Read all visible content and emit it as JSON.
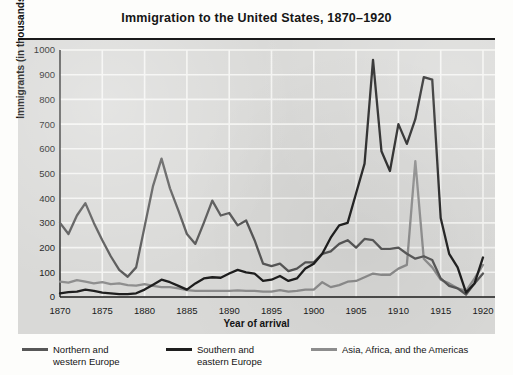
{
  "title": "Immigration to the United States, 1870–1920",
  "axes": {
    "ylabel": "Immigrants (in thousands)",
    "xlabel": "Year of arrival",
    "yticks": [
      "0",
      "100",
      "200",
      "300",
      "400",
      "500",
      "600",
      "700",
      "800",
      "900",
      "1000"
    ],
    "xticks": [
      "1870",
      "1875",
      "1880",
      "1885",
      "1890",
      "1895",
      "1900",
      "1905",
      "1910",
      "1915",
      "1920"
    ]
  },
  "legend": [
    {
      "label_line1": "Northern and",
      "label_line2": "western Europe",
      "color": "#575757"
    },
    {
      "label_line1": "Southern and",
      "label_line2": "eastern Europe",
      "color": "#1e1e1e"
    },
    {
      "label_line1": "Asia, Africa, and the Americas",
      "label_line2": "",
      "color": "#8d8d8d"
    }
  ],
  "colors": {
    "panel": "#d9d9d7",
    "gridline": "#f4f4f2",
    "axis": "#1b1b1b",
    "page": "#fdfdfb"
  },
  "chart_data": {
    "type": "line",
    "title": "Immigration to the United States, 1870–1920",
    "xlabel": "Year of arrival",
    "ylabel": "Immigrants (in thousands)",
    "xlim": [
      1870,
      1920
    ],
    "ylim": [
      0,
      1000
    ],
    "xtick_step": 5,
    "ytick_step": 100,
    "grid": true,
    "legend_position": "below",
    "units": "thousands of immigrants",
    "x": [
      1870,
      1871,
      1872,
      1873,
      1874,
      1875,
      1876,
      1877,
      1878,
      1879,
      1880,
      1881,
      1882,
      1883,
      1884,
      1885,
      1886,
      1887,
      1888,
      1889,
      1890,
      1891,
      1892,
      1893,
      1894,
      1895,
      1896,
      1897,
      1898,
      1899,
      1900,
      1901,
      1902,
      1903,
      1904,
      1905,
      1906,
      1907,
      1908,
      1909,
      1910,
      1911,
      1912,
      1913,
      1914,
      1915,
      1916,
      1917,
      1918,
      1919,
      1920
    ],
    "series": [
      {
        "name": "Northern and western Europe",
        "color": "#575757",
        "values": [
          300,
          255,
          330,
          380,
          300,
          230,
          165,
          110,
          82,
          120,
          285,
          450,
          560,
          440,
          350,
          255,
          215,
          300,
          390,
          330,
          340,
          290,
          310,
          230,
          135,
          125,
          135,
          105,
          115,
          140,
          140,
          175,
          185,
          215,
          230,
          200,
          235,
          230,
          195,
          195,
          200,
          175,
          155,
          165,
          150,
          75,
          45,
          35,
          10,
          55,
          95
        ]
      },
      {
        "name": "Southern and eastern Europe",
        "color": "#1e1e1e",
        "values": [
          15,
          20,
          22,
          30,
          25,
          18,
          15,
          12,
          12,
          15,
          30,
          50,
          70,
          60,
          45,
          30,
          55,
          75,
          80,
          78,
          95,
          110,
          100,
          95,
          65,
          70,
          85,
          65,
          75,
          115,
          135,
          175,
          240,
          290,
          300,
          420,
          540,
          960,
          590,
          510,
          700,
          620,
          720,
          890,
          880,
          320,
          175,
          120,
          18,
          55,
          160
        ]
      },
      {
        "name": "Asia, Africa, and the Americas",
        "color": "#8d8d8d",
        "values": [
          62,
          58,
          68,
          62,
          55,
          60,
          52,
          55,
          48,
          46,
          52,
          45,
          40,
          40,
          35,
          28,
          25,
          25,
          25,
          25,
          25,
          27,
          25,
          25,
          22,
          22,
          28,
          22,
          25,
          30,
          30,
          60,
          40,
          48,
          62,
          65,
          80,
          95,
          90,
          90,
          115,
          130,
          550,
          155,
          120,
          70,
          55,
          35,
          25,
          75,
          130
        ]
      }
    ]
  }
}
